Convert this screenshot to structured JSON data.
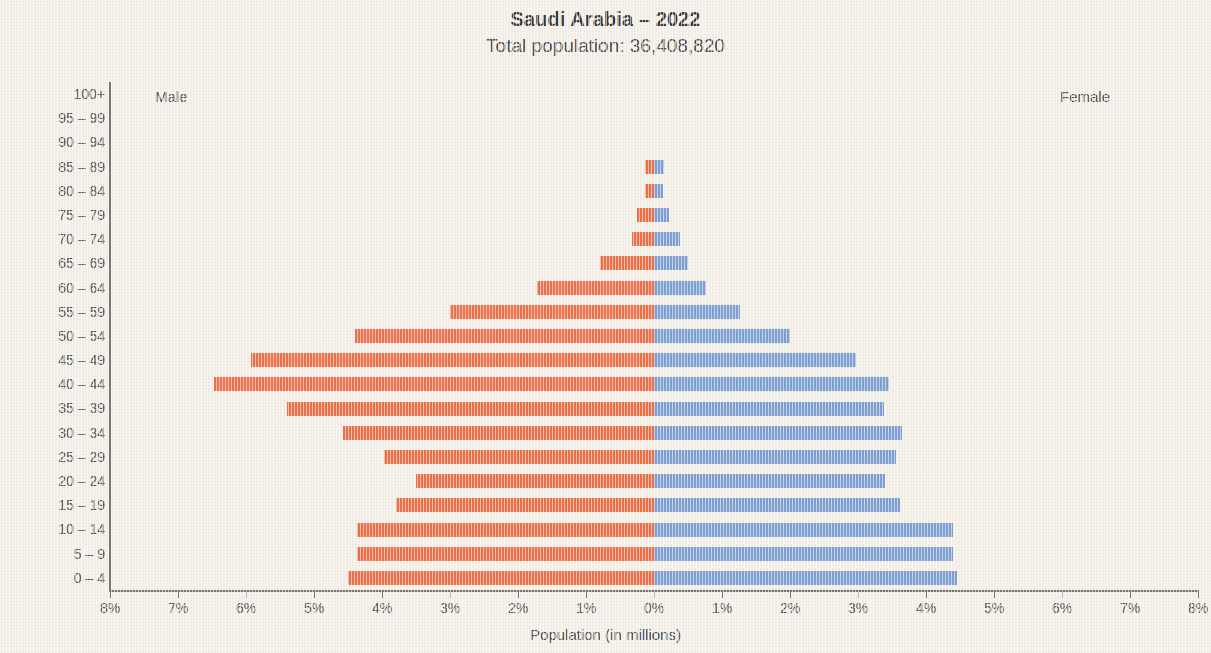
{
  "chart_data": {
    "type": "bar",
    "subtype": "population-pyramid",
    "title": "Saudi Arabia – 2022",
    "subtitle": "Total population: 36,408,820",
    "xlabel": "Population (in millions)",
    "ylabel": "Age group",
    "grid": false,
    "legend_position": "inline-top",
    "left_series_label": "Male",
    "right_series_label": "Female",
    "xlim": [
      -8,
      8
    ],
    "xtick_values": [
      -8,
      -7,
      -6,
      -5,
      -4,
      -3,
      -2,
      -1,
      0,
      1,
      2,
      3,
      4,
      5,
      6,
      7,
      8
    ],
    "xtick_labels": [
      "8%",
      "7%",
      "6%",
      "5%",
      "4%",
      "3%",
      "2%",
      "1%",
      "0%",
      "1%",
      "2%",
      "3%",
      "4%",
      "5%",
      "6%",
      "7%",
      "8%"
    ],
    "units": "percent of total population",
    "categories": [
      "100+",
      "95 – 99",
      "90 – 94",
      "85 – 89",
      "80 – 84",
      "75 – 79",
      "70 – 74",
      "65 – 69",
      "60 – 64",
      "55 – 59",
      "50 – 54",
      "45 – 49",
      "40 – 44",
      "35 – 39",
      "30 – 34",
      "25 – 29",
      "20 – 24",
      "15 – 19",
      "10 – 14",
      "5 – 9",
      "0 – 4"
    ],
    "series": [
      {
        "name": "Male",
        "color": "#ec7049",
        "side": "left",
        "values": [
          0.0,
          0.0,
          0.0,
          0.13,
          0.13,
          0.25,
          0.32,
          0.8,
          1.72,
          3.0,
          4.4,
          5.93,
          6.47,
          5.4,
          4.57,
          3.97,
          3.5,
          3.8,
          4.37,
          4.37,
          4.5
        ]
      },
      {
        "name": "Female",
        "color": "#7e9fd1",
        "side": "right",
        "values": [
          0.0,
          0.0,
          0.0,
          0.15,
          0.13,
          0.22,
          0.38,
          0.5,
          0.77,
          1.27,
          2.0,
          2.97,
          3.46,
          3.38,
          3.65,
          3.56,
          3.4,
          3.62,
          4.4,
          4.4,
          4.46
        ]
      }
    ]
  },
  "colors": {
    "background": "#f3efe7",
    "male": "#ec7049",
    "female": "#7e9fd1",
    "axis": "#7a7771",
    "text": "#4a4a4a"
  }
}
